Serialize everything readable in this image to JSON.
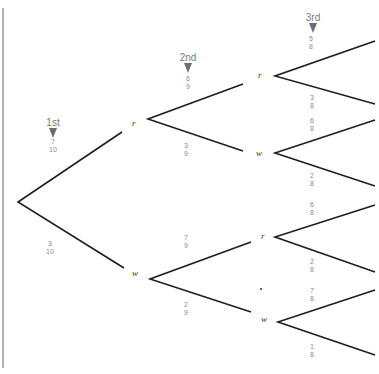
{
  "diagram": {
    "type": "probability-tree",
    "stages": [
      {
        "label": "1st"
      },
      {
        "label": "2nd"
      },
      {
        "label": "3rd"
      }
    ],
    "nodes": {
      "level1": [
        {
          "label": "r"
        },
        {
          "label": "w"
        }
      ],
      "level2": [
        {
          "label": "r"
        },
        {
          "label": "w"
        },
        {
          "label": "r"
        },
        {
          "label": "w"
        }
      ]
    },
    "probabilities": {
      "level1": [
        {
          "num": "7",
          "den": "10"
        },
        {
          "num": "3",
          "den": "10"
        }
      ],
      "level2": [
        {
          "num": "6",
          "den": "9"
        },
        {
          "num": "3",
          "den": "9"
        },
        {
          "num": "7",
          "den": "9"
        },
        {
          "num": "2",
          "den": "9"
        }
      ],
      "level3": [
        {
          "num": "5",
          "den": "8"
        },
        {
          "num": "3",
          "den": "8"
        },
        {
          "num": "6",
          "den": "8"
        },
        {
          "num": "2",
          "den": "8"
        },
        {
          "num": "6",
          "den": "8"
        },
        {
          "num": "2",
          "den": "8"
        },
        {
          "num": "7",
          "den": "8"
        },
        {
          "num": "1",
          "den": "8"
        }
      ]
    },
    "colors": {
      "line": "#1e1e1e",
      "text": "#8a8a8a",
      "border": "#9a9a9a"
    }
  }
}
